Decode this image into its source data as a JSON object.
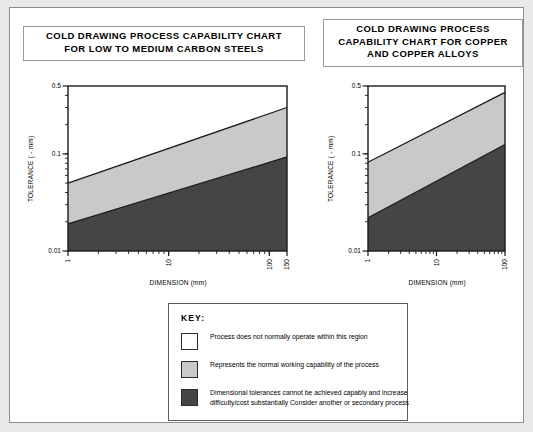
{
  "charts": [
    {
      "id": "carbon-steels",
      "title_lines": [
        "COLD DRAWING PROCESS CAPABILITY CHART",
        "FOR LOW TO MEDIUM CARBON STEELS"
      ],
      "title_text": "COLD DRAWING PROCESS CAPABILITY CHART FOR LOW TO MEDIUM CARBON STEELS"
    },
    {
      "id": "copper-alloys",
      "title_lines": [
        "COLD DRAWING PROCESS",
        "CAPABILITY CHART FOR COPPER",
        "AND COPPER ALLOYS"
      ],
      "title_text": "COLD DRAWING PROCESS CAPABILITY CHART FOR COPPER AND COPPER ALLOYS"
    }
  ],
  "key": {
    "title": "KEY:",
    "items": [
      {
        "color": "#ffffff",
        "text": "Process does not normally operate within this region"
      },
      {
        "color": "#c9c9c9",
        "text": "Represents the normal working capability of the process"
      },
      {
        "color": "#454545",
        "text": "Dimensional tolerances cannot be achieved capably and increase difficulty/cost substantially Consider another or secondary process"
      }
    ]
  },
  "colors": {
    "band_normal": "#c9c9c9",
    "band_difficult": "#454545",
    "band_outside": "#ffffff",
    "line": "#1a1a1a",
    "page_background": "#e9e9e9",
    "panel_background": "#ffffff"
  },
  "chart_data": [
    {
      "type": "area",
      "id": "carbon-steels",
      "title": "COLD DRAWING PROCESS CAPABILITY CHART FOR LOW TO MEDIUM CARBON STEELS",
      "xlabel": "DIMENSION (mm)",
      "ylabel": "TOLERANCE ( - mm)",
      "xscale": "log",
      "yscale": "log",
      "xlim": [
        1,
        150
      ],
      "ylim": [
        0.01,
        0.5
      ],
      "xticks": [
        1,
        10,
        100,
        150
      ],
      "xtick_labels": [
        "1",
        "10",
        "100",
        "150"
      ],
      "yticks": [
        0.01,
        0.1,
        0.5
      ],
      "ytick_labels": [
        "0.01",
        "0.1",
        "0.5"
      ],
      "grid": false,
      "legend": "external key box",
      "series": [
        {
          "name": "Upper boundary (normal capability / not normally operated)",
          "x": [
            1,
            150
          ],
          "values": [
            0.05,
            0.3
          ]
        },
        {
          "name": "Lower boundary (normal capability / difficult)",
          "x": [
            1,
            150
          ],
          "values": [
            0.019,
            0.093
          ]
        }
      ],
      "regions": [
        {
          "name": "Process does not normally operate within this region",
          "fill": "#ffffff",
          "above": "Upper boundary"
        },
        {
          "name": "Represents the normal working capability of the process",
          "fill": "#c9c9c9",
          "between": [
            "Lower boundary",
            "Upper boundary"
          ]
        },
        {
          "name": "Dimensional tolerances cannot be achieved capably",
          "fill": "#454545",
          "below": "Lower boundary"
        }
      ]
    },
    {
      "type": "area",
      "id": "copper-alloys",
      "title": "COLD DRAWING PROCESS CAPABILITY CHART FOR COPPER AND COPPER ALLOYS",
      "xlabel": "DIMENSION (mm)",
      "ylabel": "TOLERANCE ( - mm)",
      "xscale": "log",
      "yscale": "log",
      "xlim": [
        1,
        100
      ],
      "ylim": [
        0.01,
        0.5
      ],
      "xticks": [
        1,
        10,
        100
      ],
      "xtick_labels": [
        "1",
        "10",
        "100"
      ],
      "yticks": [
        0.01,
        0.1,
        0.5
      ],
      "ytick_labels": [
        "0.01",
        "0.1",
        "0.5"
      ],
      "grid": false,
      "legend": "external key box",
      "series": [
        {
          "name": "Upper boundary (normal capability / not normally operated)",
          "x": [
            1,
            100
          ],
          "values": [
            0.082,
            0.43
          ]
        },
        {
          "name": "Lower boundary (normal capability / difficult)",
          "x": [
            1,
            100
          ],
          "values": [
            0.022,
            0.125
          ]
        }
      ],
      "regions": [
        {
          "name": "Process does not normally operate within this region",
          "fill": "#ffffff",
          "above": "Upper boundary"
        },
        {
          "name": "Represents the normal working capability of the process",
          "fill": "#c9c9c9",
          "between": [
            "Lower boundary",
            "Upper boundary"
          ]
        },
        {
          "name": "Dimensional tolerances cannot be achieved capably",
          "fill": "#454545",
          "below": "Lower boundary"
        }
      ]
    }
  ]
}
